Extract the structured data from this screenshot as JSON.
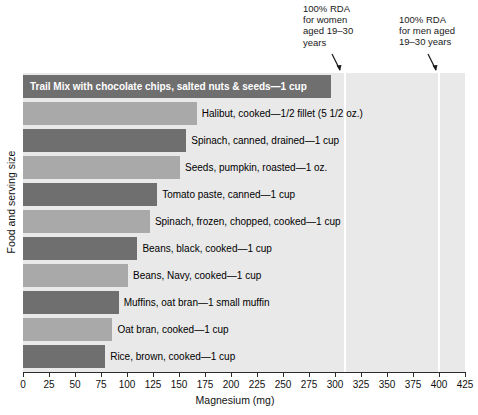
{
  "chart_data": {
    "type": "bar",
    "orientation": "horizontal",
    "title": "",
    "xlabel": "Magnesium (mg)",
    "ylabel": "Food and serving size",
    "xlim": [
      0,
      425
    ],
    "xticks": [
      0,
      25,
      50,
      75,
      100,
      125,
      150,
      175,
      200,
      225,
      250,
      275,
      300,
      325,
      350,
      375,
      400,
      425
    ],
    "grid": false,
    "legend": "none",
    "categories": [
      "Trail Mix with chocolate chips, salted nuts & seeds—1 cup",
      "Halibut, cooked—1/2 fillet (5 1/2 oz.)",
      "Spinach, canned, drained—1 cup",
      "Seeds, pumpkin, roasted—1 oz.",
      "Tomato paste, canned—1 cup",
      "Spinach, frozen, chopped, cooked—1 cup",
      "Beans, black, cooked—1 cup",
      "Beans, Navy, cooked—1 cup",
      "Muffins, oat bran—1 small muffin",
      "Oat bran, cooked—1 cup",
      "Rice, brown, cooked—1 cup"
    ],
    "values": [
      296,
      167,
      157,
      151,
      129,
      122,
      110,
      101,
      92,
      86,
      79
    ],
    "bar_colors": [
      "#6f6f6f",
      "#a9a9a9",
      "#6f6f6f",
      "#a9a9a9",
      "#6f6f6f",
      "#a9a9a9",
      "#6f6f6f",
      "#a9a9a9",
      "#6f6f6f",
      "#a9a9a9",
      "#6f6f6f"
    ],
    "label_placement": [
      "inside",
      "outside",
      "outside",
      "outside",
      "outside",
      "outside",
      "outside",
      "outside",
      "outside",
      "outside",
      "outside"
    ],
    "plot_background": "#e9e9e9",
    "reference_lines": [
      {
        "name": "rda-women",
        "value": 310,
        "color": "#ffffff",
        "annotation": "100% RDA\nfor women\naged 19–30\nyears"
      },
      {
        "name": "rda-men",
        "value": 400,
        "color": "#ffffff",
        "annotation": "100% RDA\nfor men aged\n19–30 years"
      }
    ]
  }
}
